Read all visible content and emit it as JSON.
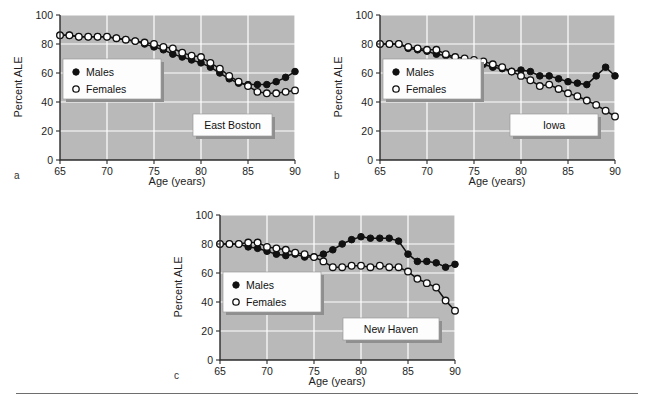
{
  "figure": {
    "panel_labels": [
      "a",
      "b",
      "c"
    ],
    "legend": {
      "males_label": "Males",
      "females_label": "Females",
      "male_marker": "filled-circle-icon",
      "female_marker": "open-circle-icon"
    },
    "axis": {
      "xlabel": "Age (years)",
      "ylabel": "Percent ALE",
      "xticks": [
        65,
        70,
        75,
        80,
        85,
        90
      ],
      "yticks": [
        0,
        20,
        40,
        60,
        80,
        100
      ]
    },
    "colors": {
      "plot_background": "#b9b9b9",
      "gridline": "#ffffff",
      "series": "#111111",
      "page_background": "#ffffff"
    }
  },
  "chart_data": [
    {
      "type": "line",
      "title": "East Boston",
      "panel": "a",
      "xlabel": "Age (years)",
      "ylabel": "Percent ALE",
      "xlim": [
        65,
        90
      ],
      "ylim": [
        0,
        100
      ],
      "grid": true,
      "legend_position": "upper-left-inset",
      "x": [
        65,
        66,
        67,
        68,
        69,
        70,
        71,
        72,
        73,
        74,
        75,
        76,
        77,
        78,
        79,
        80,
        81,
        82,
        83,
        84,
        85,
        86,
        87,
        88,
        89,
        90
      ],
      "series": [
        {
          "name": "Males",
          "marker": "filled-circle",
          "values": [
            86,
            86,
            85,
            85,
            85,
            85,
            84,
            83,
            82,
            80,
            78,
            76,
            73,
            71,
            69,
            67,
            64,
            60,
            56,
            53,
            52,
            52,
            52,
            54,
            57,
            61
          ]
        },
        {
          "name": "Females",
          "marker": "open-circle",
          "values": [
            86,
            86,
            85,
            85,
            85,
            85,
            84,
            83,
            82,
            81,
            80,
            78,
            77,
            74,
            72,
            71,
            67,
            63,
            58,
            54,
            51,
            47,
            46,
            46,
            47,
            48
          ]
        }
      ]
    },
    {
      "type": "line",
      "title": "Iowa",
      "panel": "b",
      "xlabel": "Age (years)",
      "ylabel": "Percent ALE",
      "xlim": [
        65,
        90
      ],
      "ylim": [
        0,
        100
      ],
      "grid": true,
      "legend_position": "upper-left-inset",
      "x": [
        65,
        66,
        67,
        68,
        69,
        70,
        71,
        72,
        73,
        74,
        75,
        76,
        77,
        78,
        79,
        80,
        81,
        82,
        83,
        84,
        85,
        86,
        87,
        88,
        89,
        90
      ],
      "series": [
        {
          "name": "Males",
          "marker": "filled-circle",
          "values": [
            80,
            80,
            80,
            77,
            76,
            75,
            73,
            72,
            70,
            68,
            67,
            66,
            64,
            63,
            61,
            62,
            61,
            58,
            58,
            56,
            54,
            53,
            52,
            58,
            64,
            58
          ]
        },
        {
          "name": "Females",
          "marker": "open-circle",
          "values": [
            80,
            80,
            80,
            78,
            77,
            76,
            76,
            73,
            71,
            70,
            69,
            68,
            66,
            64,
            61,
            58,
            55,
            51,
            52,
            49,
            46,
            44,
            41,
            38,
            34,
            30
          ]
        }
      ]
    },
    {
      "type": "line",
      "title": "New Haven",
      "panel": "c",
      "xlabel": "Age (years)",
      "ylabel": "Percent ALE",
      "xlim": [
        65,
        90
      ],
      "ylim": [
        0,
        100
      ],
      "grid": true,
      "legend_position": "upper-left-inset",
      "x": [
        65,
        66,
        67,
        68,
        69,
        70,
        71,
        72,
        73,
        74,
        75,
        76,
        77,
        78,
        79,
        80,
        81,
        82,
        83,
        84,
        85,
        86,
        87,
        88,
        89,
        90
      ],
      "series": [
        {
          "name": "Males",
          "marker": "filled-circle",
          "values": [
            80,
            80,
            80,
            78,
            77,
            75,
            73,
            72,
            73,
            71,
            71,
            73,
            76,
            80,
            83,
            85,
            84,
            84,
            84,
            82,
            73,
            68,
            68,
            67,
            64,
            66
          ]
        },
        {
          "name": "Females",
          "marker": "open-circle",
          "values": [
            80,
            80,
            80,
            81,
            81,
            78,
            77,
            76,
            74,
            73,
            71,
            68,
            64,
            64,
            65,
            65,
            64,
            65,
            64,
            64,
            61,
            56,
            53,
            50,
            41,
            34
          ]
        }
      ]
    }
  ]
}
